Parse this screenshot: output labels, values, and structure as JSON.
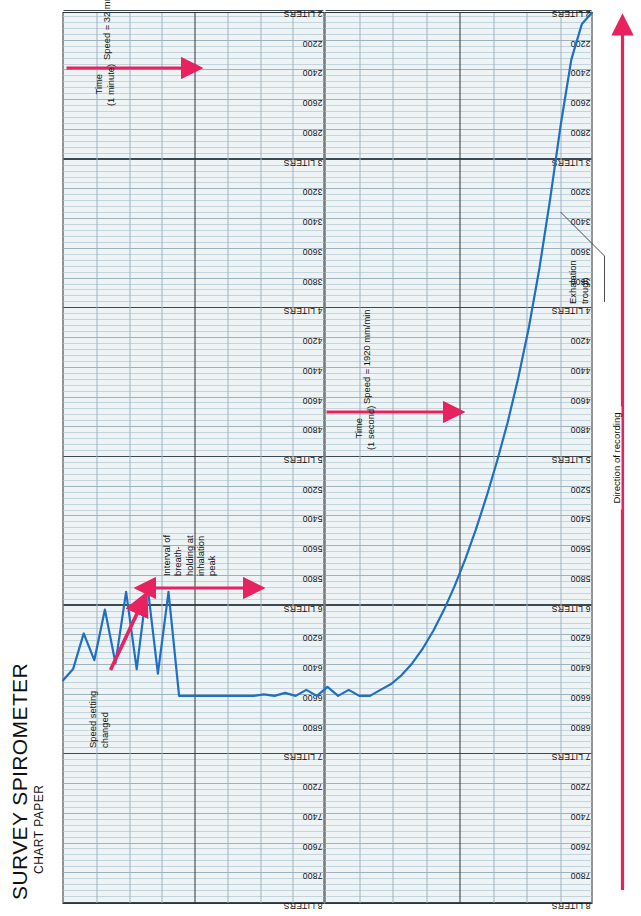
{
  "document": {
    "title_line1": "SURVEY SPIROMETER",
    "title_line2": "CHART PAPER"
  },
  "colors": {
    "trace": "#1f6fc4",
    "annotation_red": "#e8225e",
    "grid_minor": "#9fb2bd",
    "grid_major": "#333333",
    "paper": "#eef4f6"
  },
  "annotations": {
    "speed_changed": "Speed setting\nchanged",
    "breath_hold": "Interval of\nbreath-\nholding at\ninhalation\npeak",
    "exhalation_trough": "Exhalation\ntrough",
    "time_1_second": "Time\n(1 second)",
    "speed_1920": "Speed = 1920 mm/min",
    "time_1_minute": "Time\n(1 minute)",
    "speed_32": "Speed = 32 mm/min",
    "direction_of_recording": "Direction of recording"
  },
  "chart_data": {
    "type": "line",
    "title": "SURVEY SPIROMETER CHART PAPER",
    "xlabel": "Time (direction of recording)",
    "ylabel": "Volume (mL)",
    "grid": true,
    "legend": "none",
    "ylim": [
      2000,
      8000
    ],
    "y_tick_step": 200,
    "y_tick_labels": [
      "8 LITERS",
      "7800",
      "7600",
      "7400",
      "7200",
      "7 LITERS",
      "6800",
      "6600",
      "6400",
      "6200",
      "6 LITERS",
      "5800",
      "5600",
      "5400",
      "5200",
      "5 LITERS",
      "4800",
      "4600",
      "4400",
      "4200",
      "4 LITERS",
      "3800",
      "3600",
      "3400",
      "3200",
      "3 LITERS",
      "2800",
      "2600",
      "2400",
      "2200",
      "2 LITERS"
    ],
    "y_tick_values": [
      8000,
      7800,
      7600,
      7400,
      7200,
      7000,
      6800,
      6600,
      6400,
      6200,
      6000,
      5800,
      5600,
      5400,
      5200,
      5000,
      4800,
      4600,
      4400,
      4200,
      4000,
      3800,
      3600,
      3400,
      3200,
      3000,
      2800,
      2600,
      2400,
      2200,
      2000
    ],
    "speeds": [
      {
        "label": "Speed = 1920 mm/min",
        "interval": "1 second"
      },
      {
        "label": "Speed = 32 mm/min",
        "interval": "1 minute"
      }
    ],
    "series": [
      {
        "name": "Spirogram trace",
        "x": [
          0,
          2,
          4,
          6,
          8,
          10,
          12,
          14,
          16,
          18,
          20,
          22,
          24,
          26,
          28,
          30,
          32,
          34,
          36,
          38,
          40,
          42,
          44,
          46,
          48,
          50,
          52,
          54,
          56,
          58,
          60,
          62,
          64,
          66,
          68,
          70,
          72,
          74,
          76,
          78,
          80,
          82,
          84,
          86,
          88,
          90,
          92,
          94,
          96,
          98,
          100
        ],
        "y": [
          2000,
          2080,
          2320,
          2760,
          3260,
          3720,
          4120,
          4460,
          4760,
          5020,
          5260,
          5480,
          5680,
          5860,
          6020,
          6160,
          6280,
          6380,
          6460,
          6520,
          6560,
          6600,
          6600,
          6560,
          6600,
          6540,
          6600,
          6560,
          6600,
          6580,
          6600,
          6590,
          6600,
          6600,
          6600,
          6600,
          6600,
          6600,
          6600,
          6600,
          5900,
          6450,
          5850,
          6420,
          5900,
          6380,
          6020,
          6360,
          6180,
          6420,
          6500
        ],
        "notes": "Inhalation ramp, breath-hold plateau at 6600 mL, then resumed tidal breathing (sawtooth)"
      }
    ],
    "features": [
      {
        "name": "exhalation trough",
        "value": 2000,
        "units": "mL"
      },
      {
        "name": "inhalation peak / breath-hold plateau",
        "value": 6600,
        "units": "mL"
      }
    ]
  }
}
